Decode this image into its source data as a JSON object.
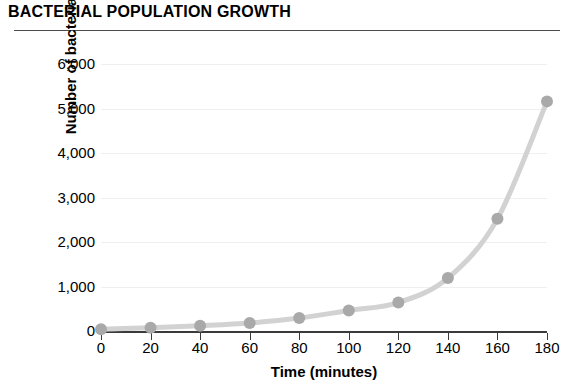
{
  "chart_data": {
    "type": "line",
    "title": "BACTERIAL POPULATION GROWTH",
    "xlabel": "Time (minutes)",
    "ylabel": "Number of bacteria",
    "x": [
      0,
      20,
      40,
      60,
      80,
      100,
      120,
      140,
      160,
      180
    ],
    "values": [
      40,
      75,
      120,
      180,
      290,
      460,
      640,
      1190,
      2520,
      5160
    ],
    "series": [
      {
        "name": "Number of bacteria",
        "values": [
          40,
          75,
          120,
          180,
          290,
          460,
          640,
          1190,
          2520,
          5160
        ]
      }
    ],
    "xlim": [
      0,
      180
    ],
    "ylim": [
      0,
      6000
    ],
    "xticks": [
      0,
      20,
      40,
      60,
      80,
      100,
      120,
      140,
      160,
      180
    ],
    "yticks": [
      0,
      1000,
      2000,
      3000,
      4000,
      5000,
      6000
    ],
    "xtick_labels": [
      "0",
      "20",
      "40",
      "60",
      "80",
      "100",
      "120",
      "140",
      "160",
      "180"
    ],
    "ytick_labels": [
      "0",
      "1,000",
      "2,000",
      "3,000",
      "4,000",
      "5,000",
      "6,000"
    ],
    "grid": true,
    "legend": false,
    "line_color": "#d2d2d2",
    "marker_color": "#a9a9a9",
    "axis_color": "#3a3a3a",
    "grid_color": "#efefef"
  }
}
